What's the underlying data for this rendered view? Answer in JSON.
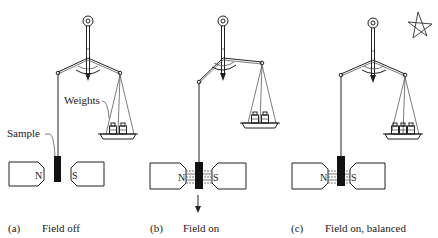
{
  "labels": {
    "weights": "Weights",
    "sample": "Sample",
    "north": "N",
    "south": "S"
  },
  "panels": [
    {
      "id": "a",
      "marker": "(a)",
      "caption": "Field off",
      "field": false,
      "sample_pulled_down": false,
      "balanced": true,
      "weight_count": 2
    },
    {
      "id": "b",
      "marker": "(b)",
      "caption": "Field on",
      "field": true,
      "sample_pulled_down": true,
      "balanced": false,
      "weight_count": 2,
      "force_arrow": "down"
    },
    {
      "id": "c",
      "marker": "(c)",
      "caption": "Field on, balanced",
      "field": true,
      "sample_pulled_down": true,
      "balanced": true,
      "weight_count": 3
    }
  ],
  "decorations": {
    "corner_mark": "star-doodle"
  },
  "colors": {
    "ink": "#222222",
    "background": "#ffffff"
  }
}
